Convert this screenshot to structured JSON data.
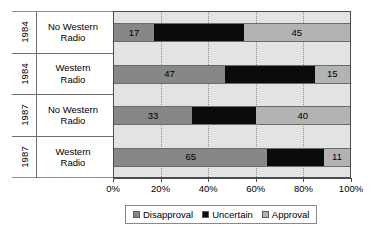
{
  "chart_data": {
    "type": "bar",
    "orientation": "horizontal",
    "stacked": true,
    "stack_total": 100,
    "title": "",
    "xlabel": "",
    "ylabel": "",
    "xlim": [
      0,
      100
    ],
    "grid": true,
    "legend_position": "bottom",
    "x_ticks": [
      "0%",
      "20%",
      "40%",
      "60%",
      "80%",
      "100%"
    ],
    "x_tick_values": [
      0,
      20,
      40,
      60,
      80,
      100
    ],
    "categories": [
      {
        "year": "1984",
        "group": "No Western\nRadio"
      },
      {
        "year": "1984",
        "group": "Western\nRadio"
      },
      {
        "year": "1987",
        "group": "No Western\nRadio"
      },
      {
        "year": "1987",
        "group": "Western\nRadio"
      }
    ],
    "series": [
      {
        "name": "Disapproval",
        "color": "#878787",
        "values": [
          17,
          47,
          33,
          65
        ]
      },
      {
        "name": "Uncertain",
        "color": "#0b0b0b",
        "values": [
          38,
          38,
          27,
          24
        ]
      },
      {
        "name": "Approval",
        "color": "#b3b3b3",
        "values": [
          45,
          15,
          40,
          11
        ]
      }
    ],
    "visible_data_labels": [
      {
        "row": 0,
        "series": "Disapproval",
        "label": "17"
      },
      {
        "row": 0,
        "series": "Approval",
        "label": "45"
      },
      {
        "row": 1,
        "series": "Disapproval",
        "label": "47"
      },
      {
        "row": 1,
        "series": "Approval",
        "label": "15"
      },
      {
        "row": 2,
        "series": "Disapproval",
        "label": "33"
      },
      {
        "row": 2,
        "series": "Approval",
        "label": "40"
      },
      {
        "row": 3,
        "series": "Disapproval",
        "label": "65"
      },
      {
        "row": 3,
        "series": "Approval",
        "label": "11"
      }
    ]
  },
  "rows": [
    {
      "year": "1984",
      "group": "No Western\nRadio",
      "disapproval": {
        "value": 17,
        "label": "17"
      },
      "uncertain": {
        "value": 38,
        "label": ""
      },
      "approval": {
        "value": 45,
        "label": "45"
      }
    },
    {
      "year": "1984",
      "group": "Western\nRadio",
      "disapproval": {
        "value": 47,
        "label": "47"
      },
      "uncertain": {
        "value": 38,
        "label": ""
      },
      "approval": {
        "value": 15,
        "label": "15"
      }
    },
    {
      "year": "1987",
      "group": "No Western\nRadio",
      "disapproval": {
        "value": 33,
        "label": "33"
      },
      "uncertain": {
        "value": 27,
        "label": ""
      },
      "approval": {
        "value": 40,
        "label": "40"
      }
    },
    {
      "year": "1987",
      "group": "Western\nRadio",
      "disapproval": {
        "value": 65,
        "label": "65"
      },
      "uncertain": {
        "value": 24,
        "label": ""
      },
      "approval": {
        "value": 11,
        "label": "11"
      }
    }
  ],
  "x_axis": {
    "ticks": [
      {
        "label": "0%",
        "value": 0
      },
      {
        "label": "20%",
        "value": 20
      },
      {
        "label": "40%",
        "value": 40
      },
      {
        "label": "60%",
        "value": 60
      },
      {
        "label": "80%",
        "value": 80
      },
      {
        "label": "100%",
        "value": 100
      }
    ]
  },
  "legend": {
    "items": [
      {
        "label": "Disapproval",
        "key": "disapproval"
      },
      {
        "label": "Uncertain",
        "key": "uncertain"
      },
      {
        "label": "Approval",
        "key": "approval"
      }
    ]
  }
}
